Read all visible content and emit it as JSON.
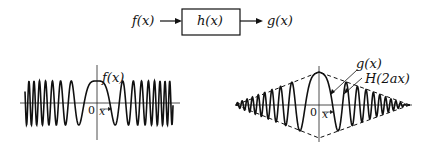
{
  "block_diagram": {
    "input": "f(x)",
    "system": "h(x)",
    "output": "g(x)"
  },
  "left_plot": {
    "curve_label": "f(x)",
    "origin_label": "0",
    "x_label": "x"
  },
  "right_plot": {
    "curve_label": "g(x)",
    "envelope_label": "H(2ax)",
    "origin_label": "0",
    "x_label": "x"
  }
}
